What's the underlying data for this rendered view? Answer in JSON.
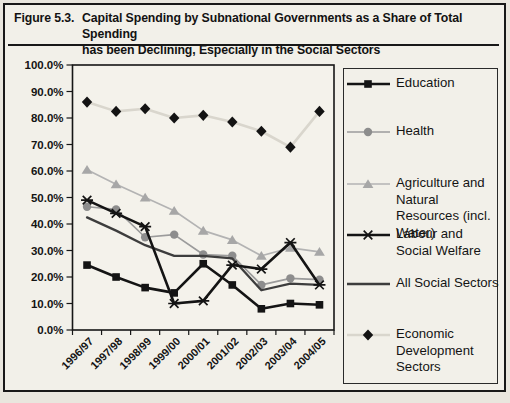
{
  "figure": {
    "label": "Figure 5.3.",
    "title_line1": "Capital Spending by Subnational Governments as a Share of Total Spending",
    "title_line2": "has been Declining, Especially in the Social Sectors"
  },
  "chart_data": {
    "type": "line",
    "title": "",
    "xlabel": "",
    "ylabel": "",
    "grid": false,
    "legend_position": "right",
    "ylim": [
      0,
      100
    ],
    "ytick_step": 10,
    "ytick_labels": [
      "0.0%",
      "10.0%",
      "20.0%",
      "30.0%",
      "40.0%",
      "50.0%",
      "60.0%",
      "70.0%",
      "80.0%",
      "90.0%",
      "100.0%"
    ],
    "categories": [
      "1996/97",
      "1997/98",
      "1998/99",
      "1999/00",
      "2000/01",
      "2001/02",
      "2002/03",
      "2003/04",
      "2004/05"
    ],
    "series": [
      {
        "id": "education",
        "name": "Education",
        "marker": "square",
        "color": "#141414",
        "line_color": "#141414",
        "line_width": 2.6,
        "values": [
          24.5,
          20,
          16,
          14,
          25,
          17,
          8,
          10,
          9.5
        ]
      },
      {
        "id": "health",
        "name": "Health",
        "marker": "circle",
        "color": "#8d8d8d",
        "line_color": "#9b9b9b",
        "line_width": 1.7,
        "values": [
          46.5,
          45.5,
          35,
          36,
          28.5,
          28,
          17,
          19.5,
          19
        ]
      },
      {
        "id": "agriculture",
        "name": "Agriculture and Natural Resources (incl. Water)",
        "marker": "triangle",
        "color": "#a7a7a7",
        "line_color": "#b3b3b3",
        "line_width": 1.7,
        "values": [
          60.5,
          55,
          50,
          45,
          37.5,
          34,
          28,
          31,
          29.5
        ]
      },
      {
        "id": "labour",
        "name": "Labour and Social Welfare",
        "marker": "asterisk",
        "color": "#141414",
        "line_color": "#141414",
        "line_width": 2.6,
        "values": [
          49,
          44,
          39,
          10,
          11,
          24.5,
          23,
          33,
          17
        ]
      },
      {
        "id": "all-social",
        "name": "All Social Sectors",
        "marker": "none",
        "color": "#3d3d3d",
        "line_color": "#3d3d3d",
        "line_width": 2.3,
        "values": [
          42.5,
          37.5,
          32,
          28,
          28,
          27,
          15,
          17.5,
          17
        ]
      },
      {
        "id": "economic",
        "name": "Economic Development Sectors",
        "marker": "diamond",
        "color": "#131313",
        "line_color": "#d9d6cd",
        "line_width": 2.6,
        "values": [
          86,
          82.5,
          83.5,
          80,
          81,
          78.5,
          75,
          69,
          82.5
        ]
      }
    ]
  }
}
